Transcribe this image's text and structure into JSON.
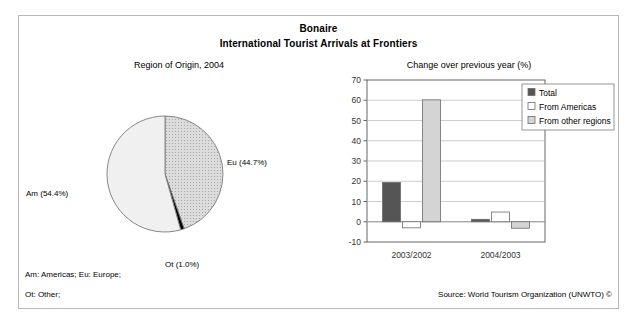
{
  "header": {
    "title": "Bonaire",
    "subtitle": "International Tourist Arrivals at Frontiers"
  },
  "panels": {
    "pie_title": "Region of Origin, 2004",
    "bar_title": "Change over previous year (%)"
  },
  "pie_labels": {
    "am": "Am (54.4%)",
    "eu": "Eu (44.7%)",
    "ot": "Ot (1.0%)"
  },
  "footer": {
    "note1": "Am: Americas; Eu: Europe;",
    "note2": "Ot: Other;",
    "source": "Source: World Tourism Organization (UNWTO) ©"
  },
  "colors": {
    "americas": "#f0f0f0",
    "europe": "#c9c9c9",
    "other": "#000000",
    "total_bar": "#555555",
    "from_americas_bar": "#ffffff",
    "from_other_bar": "#d4d4d4",
    "frame": "#b9b9b9",
    "gridline": "#c0c0c0",
    "axis": "#555555"
  },
  "chart_data": [
    {
      "type": "pie",
      "title": "Region of Origin, 2004",
      "categories": [
        "Am",
        "Eu",
        "Ot"
      ],
      "labels": [
        "Am (54.4%)",
        "Eu (44.7%)",
        "Ot (1.0%)"
      ],
      "values": [
        54.4,
        44.7,
        1.0
      ],
      "unit": "%",
      "legend": "none"
    },
    {
      "type": "bar",
      "title": "Change over previous year (%)",
      "categories": [
        "2003/2002",
        "2004/2003"
      ],
      "xlabel": "",
      "ylabel": "",
      "ylim": [
        -10,
        70
      ],
      "yticks": [
        -10,
        0,
        10,
        20,
        30,
        40,
        50,
        60,
        70
      ],
      "grid": true,
      "legend_position": "top-right",
      "series": [
        {
          "name": "Total",
          "values": [
            19.4,
            1.2
          ]
        },
        {
          "name": "From Americas",
          "values": [
            -3.0,
            4.8
          ]
        },
        {
          "name": "From other regions",
          "values": [
            60.2,
            -3.2
          ]
        }
      ]
    }
  ],
  "legend": {
    "items": [
      {
        "label": "Total"
      },
      {
        "label": "From Americas"
      },
      {
        "label": "From other regions"
      }
    ]
  },
  "axis": {
    "y_ticks": [
      "70",
      "60",
      "50",
      "40",
      "30",
      "20",
      "10",
      "0",
      "-10"
    ],
    "x_ticks": [
      "2003/2002",
      "2004/2003"
    ]
  }
}
